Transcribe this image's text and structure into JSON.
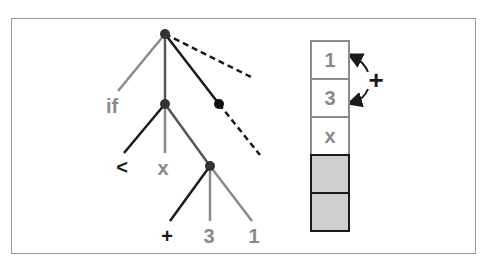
{
  "tree": {
    "nodes": [
      {
        "id": "root",
        "x": 165,
        "y": 34,
        "color": "#333333"
      },
      {
        "id": "mid",
        "x": 165,
        "y": 104,
        "color": "#333333"
      },
      {
        "id": "right",
        "x": 219,
        "y": 104,
        "color": "#111111"
      },
      {
        "id": "sub",
        "x": 210,
        "y": 166,
        "color": "#333333"
      }
    ],
    "edges": [
      {
        "x1": 165,
        "y1": 34,
        "x2": 118,
        "y2": 91,
        "color": "#8a8a8a",
        "dash": false
      },
      {
        "x1": 165,
        "y1": 34,
        "x2": 165,
        "y2": 104,
        "color": "#555555",
        "dash": false
      },
      {
        "x1": 165,
        "y1": 34,
        "x2": 219,
        "y2": 104,
        "color": "#1a1a1a",
        "dash": false
      },
      {
        "x1": 165,
        "y1": 34,
        "x2": 251,
        "y2": 77,
        "color": "#1a1a1a",
        "dash": true
      },
      {
        "x1": 219,
        "y1": 104,
        "x2": 260,
        "y2": 155,
        "color": "#1a1a1a",
        "dash": true
      },
      {
        "x1": 165,
        "y1": 104,
        "x2": 124,
        "y2": 153,
        "color": "#1a1a1a",
        "dash": false
      },
      {
        "x1": 165,
        "y1": 104,
        "x2": 165,
        "y2": 153,
        "color": "#8a8a8a",
        "dash": false
      },
      {
        "x1": 165,
        "y1": 104,
        "x2": 210,
        "y2": 166,
        "color": "#555555",
        "dash": false
      },
      {
        "x1": 210,
        "y1": 166,
        "x2": 170,
        "y2": 221,
        "color": "#1a1a1a",
        "dash": false
      },
      {
        "x1": 210,
        "y1": 166,
        "x2": 210,
        "y2": 221,
        "color": "#8a8a8a",
        "dash": false
      },
      {
        "x1": 210,
        "y1": 166,
        "x2": 252,
        "y2": 221,
        "color": "#8a8a8a",
        "dash": false
      }
    ],
    "labels": [
      {
        "text": "if",
        "x": 112,
        "y": 106,
        "tone": "gray"
      },
      {
        "text": "<",
        "x": 122,
        "y": 167,
        "tone": "dark"
      },
      {
        "text": "x",
        "x": 163,
        "y": 168,
        "tone": "gray"
      },
      {
        "text": "+",
        "x": 167,
        "y": 236,
        "tone": "dark"
      },
      {
        "text": "3",
        "x": 209,
        "y": 236,
        "tone": "gray"
      },
      {
        "text": "1",
        "x": 254,
        "y": 236,
        "tone": "gray"
      }
    ]
  },
  "stack": {
    "cells": [
      {
        "text": "1",
        "filled": true
      },
      {
        "text": "3",
        "filled": true
      },
      {
        "text": "x",
        "filled": true
      },
      {
        "text": "",
        "filled": false
      },
      {
        "text": "",
        "filled": false
      }
    ],
    "operator": "+"
  }
}
